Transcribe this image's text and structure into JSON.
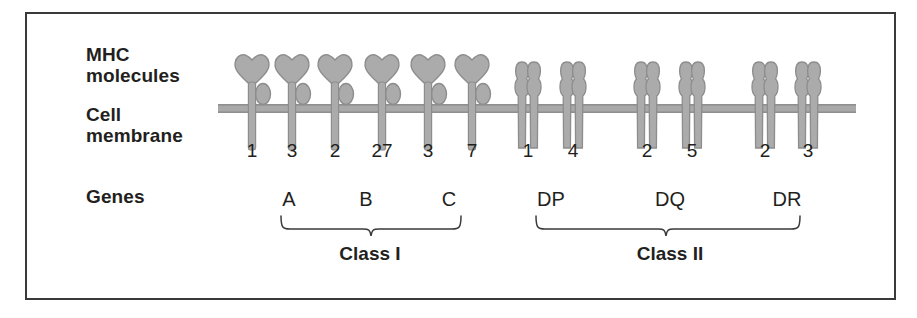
{
  "figure": {
    "type": "biology-diagram",
    "row_labels": {
      "mhc": "MHC\nmolecules",
      "membrane": "Cell\nmembrane",
      "genes": "Genes"
    },
    "colors": {
      "molecule_fill": "#ababab",
      "molecule_outline": "#8a8a8a",
      "membrane": "#a9a9a9",
      "border": "#3a3a3a",
      "text": "#231f20",
      "background": "#ffffff"
    },
    "class_labels": {
      "class1": "Class I",
      "class2": "Class II"
    },
    "class1": {
      "gene_names": [
        "A",
        "B",
        "C"
      ],
      "molecules": [
        {
          "allele": "1",
          "gene": "A",
          "x": 252
        },
        {
          "allele": "3",
          "gene": "A",
          "x": 292
        },
        {
          "allele": "2",
          "gene": "B",
          "x": 335
        },
        {
          "allele": "27",
          "gene": "B",
          "x": 382
        },
        {
          "allele": "3",
          "gene": "B",
          "x": 428
        },
        {
          "allele": "7",
          "gene": "C",
          "x": 472
        }
      ],
      "gene_label_positions": [
        289,
        366,
        449
      ]
    },
    "class2": {
      "gene_names": [
        "DP",
        "DQ",
        "DR"
      ],
      "molecules": [
        {
          "allele": "1",
          "gene": "DP",
          "x": 528
        },
        {
          "allele": "4",
          "gene": "DP",
          "x": 573
        },
        {
          "allele": "2",
          "gene": "DQ",
          "x": 647
        },
        {
          "allele": "5",
          "gene": "DQ",
          "x": 692
        },
        {
          "allele": "2",
          "gene": "DR",
          "x": 765
        },
        {
          "allele": "3",
          "gene": "DR",
          "x": 808
        }
      ],
      "gene_label_positions": [
        551,
        670,
        787
      ]
    },
    "membrane": {
      "x_start": 218,
      "x_end": 856,
      "y": 108,
      "thickness": 9
    }
  }
}
